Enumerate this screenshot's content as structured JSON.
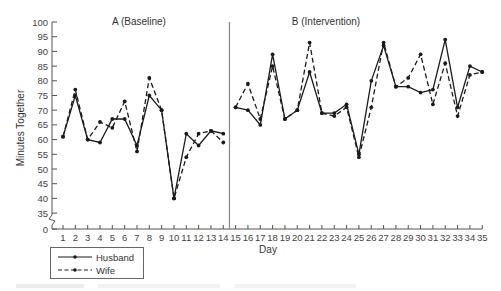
{
  "chart_data": {
    "type": "line",
    "title": "",
    "xlabel": "Day",
    "ylabel": "Minutes Together",
    "ylim": [
      0,
      100
    ],
    "axis_break": [
      0,
      35
    ],
    "yticks": [
      0,
      35,
      40,
      45,
      50,
      55,
      60,
      65,
      70,
      75,
      80,
      85,
      90,
      95,
      100
    ],
    "x": [
      1,
      2,
      3,
      4,
      5,
      6,
      7,
      8,
      9,
      10,
      11,
      12,
      13,
      14,
      15,
      16,
      17,
      18,
      19,
      20,
      21,
      22,
      23,
      24,
      25,
      26,
      27,
      28,
      29,
      30,
      31,
      32,
      33,
      34,
      35
    ],
    "phases": [
      {
        "label": "A (Baseline)",
        "start_day": 1,
        "end_day": 14
      },
      {
        "label": "B (Intervention)",
        "start_day": 15,
        "end_day": 35
      }
    ],
    "phase_line_between": [
      14,
      15
    ],
    "series": [
      {
        "name": "Husband",
        "style": "solid",
        "values": [
          61,
          75,
          60,
          59,
          67,
          67,
          58,
          75,
          70,
          40,
          62,
          58,
          63,
          62,
          71,
          70,
          65,
          89,
          67,
          70,
          83,
          69,
          69,
          72,
          55,
          80,
          92,
          78,
          78,
          76,
          77,
          94,
          71,
          85,
          83
        ]
      },
      {
        "name": "Wife",
        "style": "dashed",
        "values": [
          61,
          77,
          60,
          66,
          64,
          73,
          56,
          81,
          70,
          40,
          54,
          62,
          63,
          59,
          71,
          79,
          67,
          85,
          67,
          70,
          93,
          69,
          68,
          71,
          54,
          71,
          93,
          78,
          81,
          89,
          72,
          86,
          68,
          82,
          83
        ]
      }
    ],
    "legend": {
      "position": "bottom-left",
      "entries": [
        "Husband",
        "Wife"
      ]
    },
    "grid": false
  },
  "colors": {
    "line": "#1a1a1a",
    "axis": "#555555",
    "phase_line": "#888888"
  }
}
